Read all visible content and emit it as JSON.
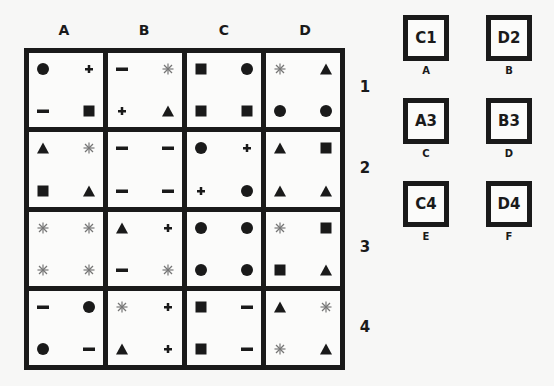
{
  "grid": {
    "columns": [
      "A",
      "B",
      "C",
      "D"
    ],
    "rows": [
      "1",
      "2",
      "3",
      "4"
    ],
    "cells": [
      [
        {
          "tl": "circle",
          "tr": "plus",
          "bl": "minus",
          "br": "square"
        },
        {
          "tl": "minus",
          "tr": "asterisk",
          "bl": "plus",
          "br": "triangle"
        },
        {
          "tl": "square",
          "tr": "circle",
          "bl": "square",
          "br": "square"
        },
        {
          "tl": "asterisk",
          "tr": "triangle",
          "bl": "circle",
          "br": "circle"
        }
      ],
      [
        {
          "tl": "triangle",
          "tr": "asterisk",
          "bl": "square",
          "br": "triangle"
        },
        {
          "tl": "minus",
          "tr": "minus",
          "bl": "minus",
          "br": "minus"
        },
        {
          "tl": "circle",
          "tr": "plus",
          "bl": "plus",
          "br": "circle"
        },
        {
          "tl": "triangle",
          "tr": "square",
          "bl": "triangle",
          "br": "triangle"
        }
      ],
      [
        {
          "tl": "asterisk",
          "tr": "asterisk",
          "bl": "asterisk",
          "br": "asterisk"
        },
        {
          "tl": "triangle",
          "tr": "plus",
          "bl": "minus",
          "br": "asterisk"
        },
        {
          "tl": "circle",
          "tr": "circle",
          "bl": "circle",
          "br": "circle"
        },
        {
          "tl": "asterisk",
          "tr": "square",
          "bl": "square",
          "br": "triangle"
        }
      ],
      [
        {
          "tl": "minus",
          "tr": "circle",
          "bl": "circle",
          "br": "minus"
        },
        {
          "tl": "asterisk",
          "tr": "plus",
          "bl": "triangle",
          "br": "plus"
        },
        {
          "tl": "square",
          "tr": "minus",
          "bl": "square",
          "br": "minus"
        },
        {
          "tl": "triangle",
          "tr": "asterisk",
          "bl": "asterisk",
          "br": "triangle"
        }
      ]
    ]
  },
  "options": [
    {
      "code": "C1",
      "label": "A"
    },
    {
      "code": "D2",
      "label": "B"
    },
    {
      "code": "A3",
      "label": "C"
    },
    {
      "code": "B3",
      "label": "D"
    },
    {
      "code": "C4",
      "label": "E"
    },
    {
      "code": "D4",
      "label": "F"
    }
  ],
  "colors": {
    "ink": "#1a1a1a",
    "asterisk": "#777777",
    "background": "#f7f7f6"
  }
}
